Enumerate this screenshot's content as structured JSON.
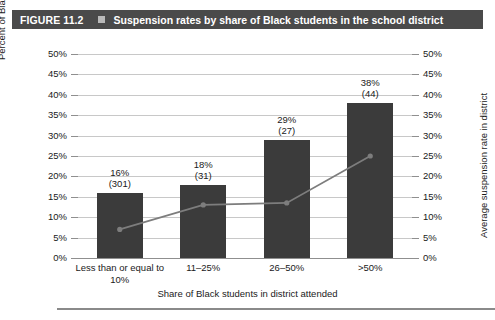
{
  "figure": {
    "label": "FIGURE 11.2",
    "marker_icon": "square-bullet-icon",
    "title": "Suspension rates by share of Black students in the school district",
    "bar_color": "#4a4a4a",
    "text_color": "#ffffff"
  },
  "chart_data": {
    "type": "bar",
    "title": "Suspension rates by share of Black students in the school district",
    "categories": [
      "Less than or equal to 10%",
      "11–25%",
      "26–50%",
      ">50%"
    ],
    "xlabel": "Share of Black students in district attended",
    "ylabel": "Percent of Black students in state (number of districts)",
    "ylabel_right": "Average suspension rate in district",
    "ylim": [
      0,
      50
    ],
    "ylim_right": [
      0,
      50
    ],
    "ytick_labels": [
      "0%",
      "5%",
      "10%",
      "15%",
      "20%",
      "25%",
      "30%",
      "35%",
      "40%",
      "45%",
      "50%"
    ],
    "ytick_values": [
      0,
      5,
      10,
      15,
      20,
      25,
      30,
      35,
      40,
      45,
      50
    ],
    "grid": true,
    "legend": "none",
    "series": [
      {
        "name": "Percent of Black students in state",
        "type": "bar",
        "values": [
          16,
          18,
          29,
          38
        ],
        "color": "#3b3b3b",
        "data_labels": [
          "16%",
          "18%",
          "29%",
          "38%"
        ],
        "district_counts": [
          301,
          31,
          27,
          44
        ],
        "district_count_labels": [
          "(301)",
          "(31)",
          "(27)",
          "(44)"
        ]
      },
      {
        "name": "Average suspension rate in district",
        "type": "line",
        "values": [
          7,
          13,
          13.5,
          25
        ],
        "color": "#7d7d7d",
        "marker": "circle"
      }
    ]
  },
  "footnote": {
    "text": ""
  }
}
